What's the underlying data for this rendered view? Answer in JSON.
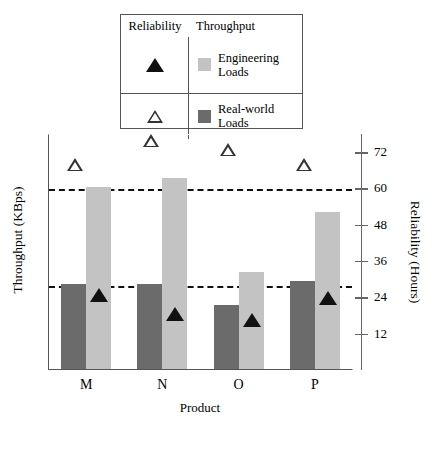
{
  "legend": {
    "header_left": "Reliability",
    "header_right": "Throughput",
    "rows": [
      {
        "marker": "filled-triangle-icon",
        "swatch_color": "#c3c3c3",
        "label": "Engineering Loads"
      },
      {
        "marker": "open-triangle-icon",
        "swatch_color": "#6b6b6b",
        "label": "Real-world Loads"
      }
    ]
  },
  "axes": {
    "left_title": "Throughput (KBps)",
    "right_title": "Reliability (Hours)",
    "x_title": "Product",
    "right_ticks": [
      "72",
      "60",
      "48",
      "36",
      "24",
      "12"
    ]
  },
  "chart_data": {
    "type": "bar",
    "title": "",
    "xlabel": "Product",
    "ylabel": "Throughput (KBps)",
    "y2label": "Reliability (Hours)",
    "categories": [
      "M",
      "N",
      "O",
      "P"
    ],
    "grid": "dashed-horizontal",
    "gridline_values": [
      60,
      28
    ],
    "legend_position": "top-center",
    "y2lim": [
      0,
      78
    ],
    "y2ticks": [
      12,
      24,
      36,
      48,
      60,
      72
    ],
    "series": [
      {
        "name": "Real-world Loads",
        "type": "bar",
        "color": "#6b6b6b",
        "values": [
          28,
          28,
          21,
          29
        ]
      },
      {
        "name": "Engineering Loads",
        "type": "bar",
        "color": "#c3c3c3",
        "values": [
          60,
          63,
          32,
          52
        ]
      },
      {
        "name": "Reliability (open triangle)",
        "type": "scatter",
        "marker": "open-triangle",
        "values": [
          68,
          76,
          73,
          68
        ]
      },
      {
        "name": "Reliability (filled triangle)",
        "type": "scatter",
        "marker": "filled-triangle",
        "values": [
          25,
          19,
          17,
          24
        ]
      }
    ]
  }
}
